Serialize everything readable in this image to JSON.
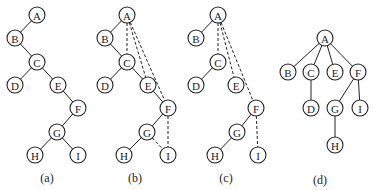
{
  "diagrams": [
    {
      "id": "a",
      "caption": "(a)",
      "nodes": [
        {
          "label": "A",
          "x": 37,
          "y": 15
        },
        {
          "label": "B",
          "x": 15,
          "y": 38
        },
        {
          "label": "C",
          "x": 37,
          "y": 62
        },
        {
          "label": "D",
          "x": 15,
          "y": 85
        },
        {
          "label": "E",
          "x": 58,
          "y": 85
        },
        {
          "label": "F",
          "x": 78,
          "y": 108
        },
        {
          "label": "G",
          "x": 57,
          "y": 132
        },
        {
          "label": "H",
          "x": 35,
          "y": 155
        },
        {
          "label": "I",
          "x": 78,
          "y": 155
        }
      ],
      "edges": [
        {
          "from": "A",
          "to": "B",
          "style": "solid"
        },
        {
          "from": "B",
          "to": "C",
          "style": "solid"
        },
        {
          "from": "C",
          "to": "D",
          "style": "solid"
        },
        {
          "from": "C",
          "to": "E",
          "style": "solid"
        },
        {
          "from": "E",
          "to": "F",
          "style": "solid"
        },
        {
          "from": "F",
          "to": "G",
          "style": "solid"
        },
        {
          "from": "G",
          "to": "H",
          "style": "solid"
        },
        {
          "from": "G",
          "to": "I",
          "style": "solid"
        }
      ],
      "caption_pos": {
        "x": 47,
        "y": 182
      }
    },
    {
      "id": "b",
      "caption": "(b)",
      "nodes": [
        {
          "label": "A",
          "x": 127,
          "y": 15
        },
        {
          "label": "B",
          "x": 105,
          "y": 38
        },
        {
          "label": "C",
          "x": 127,
          "y": 62
        },
        {
          "label": "D",
          "x": 105,
          "y": 85
        },
        {
          "label": "E",
          "x": 148,
          "y": 85
        },
        {
          "label": "F",
          "x": 168,
          "y": 108
        },
        {
          "label": "G",
          "x": 147,
          "y": 132
        },
        {
          "label": "H",
          "x": 124,
          "y": 155
        },
        {
          "label": "I",
          "x": 168,
          "y": 155
        }
      ],
      "edges": [
        {
          "from": "A",
          "to": "B",
          "style": "solid"
        },
        {
          "from": "B",
          "to": "C",
          "style": "solid"
        },
        {
          "from": "C",
          "to": "D",
          "style": "solid"
        },
        {
          "from": "C",
          "to": "E",
          "style": "solid"
        },
        {
          "from": "E",
          "to": "F",
          "style": "solid"
        },
        {
          "from": "F",
          "to": "G",
          "style": "solid"
        },
        {
          "from": "G",
          "to": "H",
          "style": "solid"
        },
        {
          "from": "G",
          "to": "I",
          "style": "dashed"
        },
        {
          "from": "A",
          "to": "C",
          "style": "dashed"
        },
        {
          "from": "A",
          "to": "E",
          "style": "dashed"
        },
        {
          "from": "A",
          "to": "F",
          "style": "dashed"
        },
        {
          "from": "F",
          "to": "I",
          "style": "dashed"
        }
      ],
      "caption_pos": {
        "x": 135,
        "y": 182
      }
    },
    {
      "id": "c",
      "caption": "(c)",
      "nodes": [
        {
          "label": "A",
          "x": 218,
          "y": 15
        },
        {
          "label": "B",
          "x": 196,
          "y": 38
        },
        {
          "label": "C",
          "x": 218,
          "y": 62
        },
        {
          "label": "D",
          "x": 196,
          "y": 85
        },
        {
          "label": "E",
          "x": 236,
          "y": 85
        },
        {
          "label": "F",
          "x": 256,
          "y": 108
        },
        {
          "label": "G",
          "x": 237,
          "y": 132
        },
        {
          "label": "H",
          "x": 215,
          "y": 155
        },
        {
          "label": "I",
          "x": 258,
          "y": 155
        }
      ],
      "edges": [
        {
          "from": "A",
          "to": "B",
          "style": "solid"
        },
        {
          "from": "C",
          "to": "D",
          "style": "solid"
        },
        {
          "from": "F",
          "to": "G",
          "style": "solid"
        },
        {
          "from": "G",
          "to": "H",
          "style": "solid"
        },
        {
          "from": "A",
          "to": "C",
          "style": "dashed"
        },
        {
          "from": "A",
          "to": "E",
          "style": "dashed"
        },
        {
          "from": "A",
          "to": "F",
          "style": "dashed"
        },
        {
          "from": "F",
          "to": "I",
          "style": "dashed"
        }
      ],
      "caption_pos": {
        "x": 226,
        "y": 182
      }
    },
    {
      "id": "d",
      "caption": "(d)",
      "nodes": [
        {
          "label": "A",
          "x": 325,
          "y": 38
        },
        {
          "label": "B",
          "x": 288,
          "y": 72
        },
        {
          "label": "C",
          "x": 311,
          "y": 72
        },
        {
          "label": "E",
          "x": 335,
          "y": 72
        },
        {
          "label": "F",
          "x": 358,
          "y": 72
        },
        {
          "label": "D",
          "x": 311,
          "y": 108
        },
        {
          "label": "G",
          "x": 335,
          "y": 108
        },
        {
          "label": "I",
          "x": 360,
          "y": 108
        },
        {
          "label": "H",
          "x": 335,
          "y": 145
        }
      ],
      "edges": [
        {
          "from": "A",
          "to": "B",
          "style": "solid"
        },
        {
          "from": "A",
          "to": "C",
          "style": "solid"
        },
        {
          "from": "A",
          "to": "E",
          "style": "solid"
        },
        {
          "from": "A",
          "to": "F",
          "style": "solid"
        },
        {
          "from": "C",
          "to": "D",
          "style": "solid"
        },
        {
          "from": "F",
          "to": "G",
          "style": "solid"
        },
        {
          "from": "F",
          "to": "I",
          "style": "solid"
        },
        {
          "from": "G",
          "to": "H",
          "style": "solid"
        }
      ],
      "caption_pos": {
        "x": 320,
        "y": 184
      }
    }
  ],
  "style": {
    "node_radius": 8,
    "stroke": "#222222",
    "background": "#ffffff"
  }
}
